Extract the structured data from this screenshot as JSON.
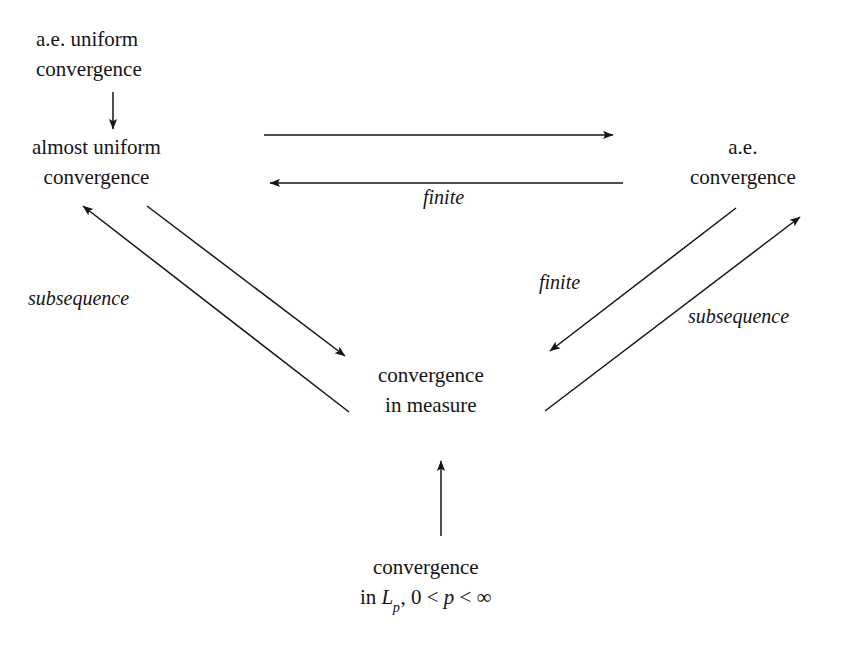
{
  "diagram": {
    "background_color": "#ffffff",
    "ink_color": "#151515",
    "nodes": [
      {
        "id": "ae_uniform",
        "lines": [
          "a.e. uniform",
          "convergence"
        ],
        "align": "left"
      },
      {
        "id": "almost_uniform",
        "lines": [
          "almost uniform",
          "convergence"
        ],
        "align": "center"
      },
      {
        "id": "ae_convergence",
        "lines": [
          "a.e.",
          "convergence"
        ],
        "align": "center"
      },
      {
        "id": "in_measure",
        "lines": [
          "convergence",
          "in measure"
        ],
        "align": "center"
      },
      {
        "id": "in_lp",
        "lines": [
          "convergence",
          "in Lp, 0 < p < ∞"
        ],
        "align": "center",
        "math_line_parts": {
          "prefix": "in ",
          "base": "L",
          "subscript": "p",
          "suffix": ", 0 < ",
          "variable": "p",
          "tail": " < ",
          "infinity": "∞"
        }
      }
    ],
    "edges": [
      {
        "id": "ae_uniform_to_almost_uniform",
        "from": "ae_uniform",
        "to": "almost_uniform",
        "label": "",
        "x1": 113,
        "y1": 92,
        "x2": 113,
        "y2": 129
      },
      {
        "id": "almost_uniform_to_ae",
        "from": "almost_uniform",
        "to": "ae_convergence",
        "label": "",
        "x1": 264,
        "y1": 135,
        "x2": 613,
        "y2": 135
      },
      {
        "id": "ae_to_almost_uniform",
        "from": "ae_convergence",
        "to": "almost_uniform",
        "label": "finite",
        "x1": 623,
        "y1": 183,
        "x2": 270,
        "y2": 183
      },
      {
        "id": "almost_uniform_to_in_measure",
        "from": "almost_uniform",
        "to": "in_measure",
        "label": "",
        "x1": 147,
        "y1": 206,
        "x2": 345,
        "y2": 356
      },
      {
        "id": "in_measure_to_almost_uniform",
        "from": "in_measure",
        "to": "almost_uniform",
        "label": "subsequence",
        "x1": 349,
        "y1": 412,
        "x2": 82,
        "y2": 205
      },
      {
        "id": "ae_to_in_measure",
        "from": "ae_convergence",
        "to": "in_measure",
        "label": "finite",
        "x1": 736,
        "y1": 208,
        "x2": 549,
        "y2": 351
      },
      {
        "id": "in_measure_to_ae",
        "from": "in_measure",
        "to": "ae_convergence",
        "label": "subsequence",
        "x1": 545,
        "y1": 411,
        "x2": 801,
        "y2": 216
      },
      {
        "id": "in_lp_to_in_measure",
        "from": "in_lp",
        "to": "in_measure",
        "label": "",
        "x1": 441,
        "y1": 536,
        "x2": 441,
        "y2": 461
      }
    ],
    "edge_labels": {
      "finite_top": "finite",
      "subsequence_left": "subsequence",
      "finite_right": "finite",
      "subsequence_right": "subsequence"
    }
  }
}
